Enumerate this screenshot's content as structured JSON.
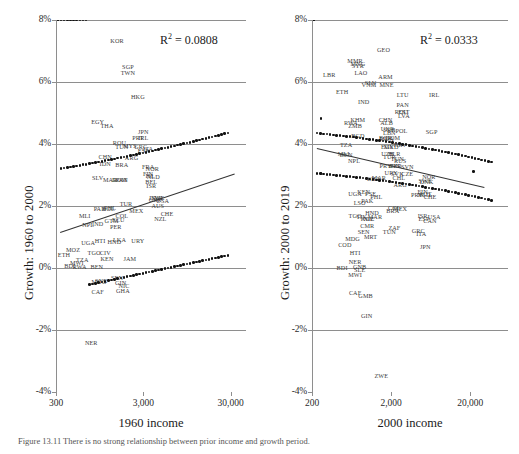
{
  "figure": {
    "caption": "Figure 13.11  There is no strong relationship between prior income and growth period."
  },
  "chart_data": [
    {
      "id": "left",
      "type": "scatter",
      "title": "",
      "xlabel": "1960 income",
      "ylabel": "Growth: 1960 to 2000",
      "annotation": "R² = 0.0808",
      "r2": 0.0808,
      "xscale": "log",
      "xlim": [
        300,
        45000
      ],
      "ylim": [
        -4,
        8
      ],
      "xticks": [
        300,
        3000,
        30000
      ],
      "xticklabels": [
        "300",
        "3,000",
        "30,000"
      ],
      "yticks": [
        -4,
        -2,
        0,
        2,
        4,
        6,
        8
      ],
      "yticklabels": [
        "-4%",
        "-2%",
        "0%",
        "2%",
        "4%",
        "6%",
        "8%"
      ],
      "grid": true,
      "legend": "none",
      "fitline": {
        "x0": 330,
        "y0": 1.16,
        "x1": 33000,
        "y1": 3.05
      },
      "points": [
        {
          "label": "ETH",
          "x": 370,
          "y": 0.45
        },
        {
          "label": "BDI",
          "x": 430,
          "y": 0.1
        },
        {
          "label": "MOZ",
          "x": 470,
          "y": 0.62
        },
        {
          "label": "MWI",
          "x": 520,
          "y": 0.18
        },
        {
          "label": "RWA",
          "x": 560,
          "y": 0.06
        },
        {
          "label": "TZA",
          "x": 600,
          "y": 0.3
        },
        {
          "label": "UGA",
          "x": 700,
          "y": 0.85
        },
        {
          "label": "NER",
          "x": 760,
          "y": -2.4
        },
        {
          "label": "MLI",
          "x": 640,
          "y": 1.7
        },
        {
          "label": "NPL",
          "x": 700,
          "y": 1.42
        },
        {
          "label": "TGO",
          "x": 820,
          "y": 0.52
        },
        {
          "label": "BEN",
          "x": 880,
          "y": 0.08
        },
        {
          "label": "CAF",
          "x": 900,
          "y": -0.75
        },
        {
          "label": "MDG",
          "x": 930,
          "y": -0.42
        },
        {
          "label": "SYR",
          "x": 990,
          "y": -0.4
        },
        {
          "label": "HTI",
          "x": 960,
          "y": 0.9
        },
        {
          "label": "IND",
          "x": 900,
          "y": 1.45
        },
        {
          "label": "PAK",
          "x": 950,
          "y": 1.95
        },
        {
          "label": "CIV",
          "x": 1100,
          "y": 0.52
        },
        {
          "label": "KEN",
          "x": 1150,
          "y": 0.32
        },
        {
          "label": "SEN",
          "x": 1500,
          "y": -0.3
        },
        {
          "label": "GIN",
          "x": 1650,
          "y": -0.45
        },
        {
          "label": "GHA",
          "x": 1750,
          "y": -0.72
        },
        {
          "label": "NIC",
          "x": 1800,
          "y": -0.55
        },
        {
          "label": "HND",
          "x": 1400,
          "y": 0.88
        },
        {
          "label": "LKA",
          "x": 1600,
          "y": 0.95
        },
        {
          "label": "JAM",
          "x": 2100,
          "y": 0.32
        },
        {
          "label": "URY",
          "x": 2600,
          "y": 0.9
        },
        {
          "label": "PER",
          "x": 1450,
          "y": 1.35
        },
        {
          "label": "GTM",
          "x": 1300,
          "y": 1.55
        },
        {
          "label": "ECU",
          "x": 1550,
          "y": 1.58
        },
        {
          "label": "PHL",
          "x": 1250,
          "y": 1.98
        },
        {
          "label": "BOL",
          "x": 1200,
          "y": 1.93
        },
        {
          "label": "COL",
          "x": 1700,
          "y": 1.72
        },
        {
          "label": "TUR",
          "x": 1900,
          "y": 2.1
        },
        {
          "label": "MEX",
          "x": 2500,
          "y": 1.88
        },
        {
          "label": "KOR",
          "x": 1500,
          "y": 7.35
        },
        {
          "label": "SGP",
          "x": 2000,
          "y": 6.52
        },
        {
          "label": "TWN",
          "x": 2000,
          "y": 6.32
        },
        {
          "label": "HKG",
          "x": 2600,
          "y": 5.55
        },
        {
          "label": "EGY",
          "x": 900,
          "y": 4.75
        },
        {
          "label": "THA",
          "x": 1150,
          "y": 4.6
        },
        {
          "label": "JPN",
          "x": 3000,
          "y": 4.42
        },
        {
          "label": "PRT",
          "x": 2600,
          "y": 4.22
        },
        {
          "label": "IRL",
          "x": 3000,
          "y": 4.22
        },
        {
          "label": "ROU",
          "x": 1600,
          "y": 4.05
        },
        {
          "label": "TUN",
          "x": 1700,
          "y": 3.95
        },
        {
          "label": "MYS",
          "x": 2100,
          "y": 3.98
        },
        {
          "label": "GRC",
          "x": 2800,
          "y": 3.95
        },
        {
          "label": "ESP",
          "x": 3000,
          "y": 3.82
        },
        {
          "label": "ITA",
          "x": 3400,
          "y": 3.88
        },
        {
          "label": "CHN",
          "x": 1100,
          "y": 3.62
        },
        {
          "label": "IDN",
          "x": 1100,
          "y": 3.4
        },
        {
          "label": "ARG",
          "x": 2200,
          "y": 3.58
        },
        {
          "label": "BRA",
          "x": 1700,
          "y": 3.35
        },
        {
          "label": "FRA",
          "x": 3400,
          "y": 3.3
        },
        {
          "label": "NOR",
          "x": 3800,
          "y": 3.22
        },
        {
          "label": "FIN",
          "x": 3400,
          "y": 3.05
        },
        {
          "label": "ISL",
          "x": 3600,
          "y": 3.0
        },
        {
          "label": "NLD",
          "x": 3900,
          "y": 2.96
        },
        {
          "label": "BEL",
          "x": 3700,
          "y": 2.82
        },
        {
          "label": "ISR",
          "x": 3700,
          "y": 2.68
        },
        {
          "label": "SLV",
          "x": 900,
          "y": 2.92
        },
        {
          "label": "MAR",
          "x": 1250,
          "y": 2.88
        },
        {
          "label": "DOM",
          "x": 1600,
          "y": 2.88
        },
        {
          "label": "PAN",
          "x": 1700,
          "y": 2.88
        },
        {
          "label": "DNK",
          "x": 4200,
          "y": 2.3
        },
        {
          "label": "SWE",
          "x": 4400,
          "y": 2.28
        },
        {
          "label": "GBR",
          "x": 4100,
          "y": 2.22
        },
        {
          "label": "USA",
          "x": 5000,
          "y": 2.18
        },
        {
          "label": "AUS",
          "x": 4400,
          "y": 2.02
        },
        {
          "label": "NZL",
          "x": 4700,
          "y": 1.62
        },
        {
          "label": "CHE",
          "x": 5600,
          "y": 1.78
        }
      ]
    },
    {
      "id": "right",
      "type": "scatter",
      "title": "",
      "xlabel": "2000 income",
      "ylabel": "Growth: 2000 to 2019",
      "annotation": "R² = 0.0333",
      "r2": 0.0333,
      "xscale": "log",
      "xlim": [
        200,
        60000
      ],
      "ylim": [
        -4,
        8
      ],
      "xticks": [
        200,
        2000,
        20000
      ],
      "xticklabels": [
        "200",
        "2,000",
        "20,000"
      ],
      "yticks": [
        -4,
        -2,
        0,
        2,
        4,
        6,
        8
      ],
      "yticklabels": [
        "-4%",
        "-2%",
        "0%",
        "2%",
        "4%",
        "6%",
        "8%"
      ],
      "grid": true,
      "legend": "none",
      "fitline": {
        "x0": 230,
        "y0": 3.88,
        "x1": 30000,
        "y1": 2.62
      },
      "points": [
        {
          "label": "GEO",
          "x": 1600,
          "y": 7.05
        },
        {
          "label": "MMR",
          "x": 700,
          "y": 6.72
        },
        {
          "label": "MNG",
          "x": 760,
          "y": 6.62
        },
        {
          "label": "SYR",
          "x": 760,
          "y": 6.55
        },
        {
          "label": "LAO",
          "x": 830,
          "y": 6.32
        },
        {
          "label": "ARM",
          "x": 1700,
          "y": 6.18
        },
        {
          "label": "LBR",
          "x": 330,
          "y": 6.25
        },
        {
          "label": "SLV",
          "x": 1100,
          "y": 6.0
        },
        {
          "label": "VNM",
          "x": 1050,
          "y": 5.92
        },
        {
          "label": "MNE",
          "x": 1750,
          "y": 5.92
        },
        {
          "label": "ETH",
          "x": 480,
          "y": 5.72
        },
        {
          "label": "LTU",
          "x": 2800,
          "y": 5.62
        },
        {
          "label": "IRL",
          "x": 7000,
          "y": 5.62
        },
        {
          "label": "IND",
          "x": 900,
          "y": 5.4
        },
        {
          "label": "PAN",
          "x": 2800,
          "y": 5.28
        },
        {
          "label": "ROU",
          "x": 2700,
          "y": 5.05
        },
        {
          "label": "EST",
          "x": 2900,
          "y": 5.05
        },
        {
          "label": "LVA",
          "x": 2900,
          "y": 4.95
        },
        {
          "label": "KHM",
          "x": 760,
          "y": 4.82
        },
        {
          "label": "RWA",
          "x": 620,
          "y": 4.72
        },
        {
          "label": "ZMB",
          "x": 700,
          "y": 4.62
        },
        {
          "label": "CHN",
          "x": 1700,
          "y": 4.82
        },
        {
          "label": "ALB",
          "x": 1750,
          "y": 4.7
        },
        {
          "label": "UKR",
          "x": 1800,
          "y": 4.52
        },
        {
          "label": "SRB",
          "x": 1900,
          "y": 4.48
        },
        {
          "label": "LBN",
          "x": 1900,
          "y": 4.38
        },
        {
          "label": "POL",
          "x": 2700,
          "y": 4.45
        },
        {
          "label": "SGP",
          "x": 6500,
          "y": 4.42
        },
        {
          "label": "BGD",
          "x": 760,
          "y": 4.28
        },
        {
          "label": "BGR",
          "x": 1700,
          "y": 4.22
        },
        {
          "label": "MDA",
          "x": 1750,
          "y": 4.2
        },
        {
          "label": "DOM",
          "x": 2100,
          "y": 4.22
        },
        {
          "label": "TZA",
          "x": 540,
          "y": 4.0
        },
        {
          "label": "HRV",
          "x": 2600,
          "y": 4.0
        },
        {
          "label": "EGY",
          "x": 1800,
          "y": 3.95
        },
        {
          "label": "MKD",
          "x": 2000,
          "y": 3.92
        },
        {
          "label": "MLI",
          "x": 500,
          "y": 3.72
        },
        {
          "label": "BEN",
          "x": 540,
          "y": 3.68
        },
        {
          "label": "UZB",
          "x": 1800,
          "y": 3.72
        },
        {
          "label": "BLR",
          "x": 2200,
          "y": 3.72
        },
        {
          "label": "TUR",
          "x": 1900,
          "y": 3.62
        },
        {
          "label": "TUN",
          "x": 2400,
          "y": 3.55
        },
        {
          "label": "NPL",
          "x": 680,
          "y": 3.48
        },
        {
          "label": "RUS",
          "x": 2600,
          "y": 3.48
        },
        {
          "label": "PRY",
          "x": 1700,
          "y": 3.32
        },
        {
          "label": "IDN",
          "x": 2200,
          "y": 3.32
        },
        {
          "label": "PER",
          "x": 2300,
          "y": 3.32
        },
        {
          "label": "SVN",
          "x": 3200,
          "y": 3.28
        },
        {
          "label": "URY",
          "x": 2000,
          "y": 3.1
        },
        {
          "label": "SVK",
          "x": 2400,
          "y": 3.08
        },
        {
          "label": "CZE",
          "x": 3200,
          "y": 3.05
        },
        {
          "label": "NOR",
          "x": 6000,
          "y": 2.98
        },
        {
          "label": "CHL",
          "x": 2500,
          "y": 2.92
        },
        {
          "label": "MAR",
          "x": 1400,
          "y": 2.92
        },
        {
          "label": "GHA",
          "x": 1200,
          "y": 2.9
        },
        {
          "label": "DNK",
          "x": 5600,
          "y": 2.8
        },
        {
          "label": "SWE",
          "x": 5400,
          "y": 2.85
        },
        {
          "label": "ARG",
          "x": 2600,
          "y": 2.72
        },
        {
          "label": "UGA",
          "x": 700,
          "y": 2.42
        },
        {
          "label": "KEN",
          "x": 900,
          "y": 2.48
        },
        {
          "label": "PSE",
          "x": 1100,
          "y": 2.42
        },
        {
          "label": "PHL",
          "x": 1300,
          "y": 2.32
        },
        {
          "label": "FIN",
          "x": 5000,
          "y": 2.5
        },
        {
          "label": "AUT",
          "x": 5400,
          "y": 2.42
        },
        {
          "label": "NLD",
          "x": 5200,
          "y": 2.4
        },
        {
          "label": "CHE",
          "x": 6200,
          "y": 2.32
        },
        {
          "label": "PRT",
          "x": 4200,
          "y": 2.4
        },
        {
          "label": "LSO",
          "x": 800,
          "y": 2.12
        },
        {
          "label": "PAK",
          "x": 1000,
          "y": 2.18
        },
        {
          "label": "COL",
          "x": 2200,
          "y": 1.98
        },
        {
          "label": "MEX",
          "x": 2600,
          "y": 1.92
        },
        {
          "label": "BRA",
          "x": 2100,
          "y": 1.88
        },
        {
          "label": "TGO",
          "x": 700,
          "y": 1.72
        },
        {
          "label": "TJK",
          "x": 850,
          "y": 1.68
        },
        {
          "label": "HND",
          "x": 1150,
          "y": 1.8
        },
        {
          "label": "NIC",
          "x": 1050,
          "y": 1.62
        },
        {
          "label": "KGZ",
          "x": 1000,
          "y": 1.62
        },
        {
          "label": "MAR2",
          "x": 1250,
          "y": 1.68
        },
        {
          "label": "CMR",
          "x": 1000,
          "y": 1.4
        },
        {
          "label": "ISR",
          "x": 5000,
          "y": 1.7
        },
        {
          "label": "ESP",
          "x": 5200,
          "y": 1.62
        },
        {
          "label": "USA",
          "x": 7000,
          "y": 1.68
        },
        {
          "label": "CAN",
          "x": 6200,
          "y": 1.55
        },
        {
          "label": "ZAF",
          "x": 2200,
          "y": 1.32
        },
        {
          "label": "TUN2",
          "x": 1900,
          "y": 1.18
        },
        {
          "label": "GRC",
          "x": 4400,
          "y": 1.22
        },
        {
          "label": "ITA",
          "x": 4800,
          "y": 1.12
        },
        {
          "label": "SEN",
          "x": 900,
          "y": 1.18
        },
        {
          "label": "MRT",
          "x": 1100,
          "y": 1.02
        },
        {
          "label": "MDG",
          "x": 650,
          "y": 0.98
        },
        {
          "label": "COD",
          "x": 520,
          "y": 0.78
        },
        {
          "label": "JPN",
          "x": 5400,
          "y": 0.72
        },
        {
          "label": "HTI",
          "x": 700,
          "y": 0.52
        },
        {
          "label": "NER",
          "x": 700,
          "y": 0.22
        },
        {
          "label": "BDI",
          "x": 480,
          "y": 0.02
        },
        {
          "label": "GNB",
          "x": 800,
          "y": 0.08
        },
        {
          "label": "SLE",
          "x": 800,
          "y": -0.02
        },
        {
          "label": "MWI",
          "x": 700,
          "y": -0.18
        },
        {
          "label": "CAF",
          "x": 700,
          "y": -0.78
        },
        {
          "label": "GMB",
          "x": 950,
          "y": -0.88
        },
        {
          "label": "GIN",
          "x": 980,
          "y": -1.5
        },
        {
          "label": "ZWE",
          "x": 1500,
          "y": -3.45
        }
      ]
    }
  ]
}
